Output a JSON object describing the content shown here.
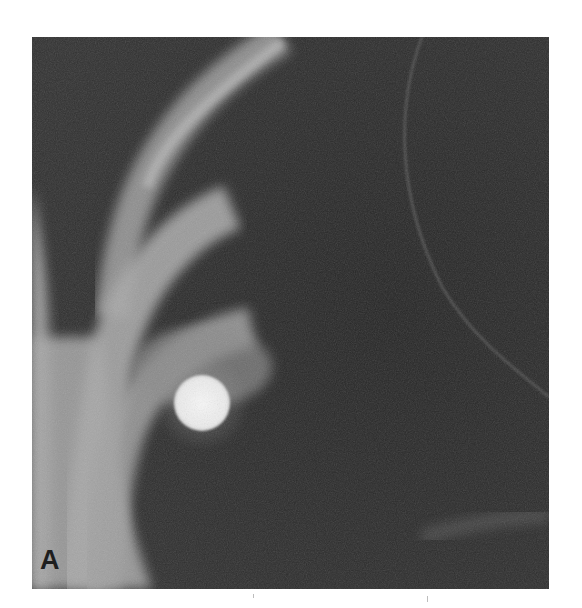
{
  "figure": {
    "panel_label": "A",
    "image_type": "chest radiograph (cropped)",
    "findings": {
      "nodule": {
        "shape": "round",
        "appearance": "dense bright opacity",
        "location": "projecting over rib near lateral chest wall"
      }
    },
    "colors": {
      "background": "#ffffff",
      "lung_field": "#2a2a2a",
      "bone": "#bfbfbf",
      "nodule": "#f2f2f2",
      "label": "#1e1e1e"
    }
  }
}
